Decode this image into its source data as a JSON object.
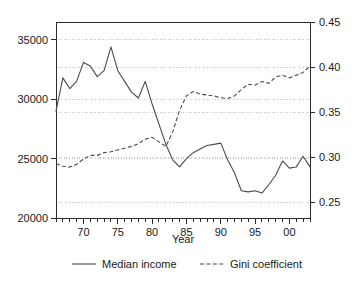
{
  "chart_data": {
    "type": "line",
    "title": "",
    "xlabel": "Year",
    "ylabel": "",
    "grid": true,
    "legend_position": "bottom",
    "x": [
      1966,
      1967,
      1968,
      1969,
      1970,
      1971,
      1972,
      1973,
      1974,
      1975,
      1976,
      1977,
      1978,
      1979,
      1980,
      1981,
      1982,
      1983,
      1984,
      1985,
      1986,
      1987,
      1988,
      1989,
      1990,
      1991,
      1992,
      1993,
      1994,
      1995,
      1996,
      1997,
      1998,
      1999,
      2000,
      2001,
      2002,
      2003
    ],
    "x_tick_labels": [
      "70",
      "75",
      "80",
      "85",
      "90",
      "95",
      "00"
    ],
    "x_tick_values": [
      1970,
      1975,
      1980,
      1985,
      1990,
      1995,
      2000
    ],
    "xlim": [
      1966,
      2003
    ],
    "left_axis": {
      "label": "Median income",
      "ylim": [
        20000,
        36500
      ],
      "ticks": [
        20000,
        25000,
        30000,
        35000
      ],
      "tick_labels": [
        "20000",
        "25000",
        "30000",
        "35000"
      ]
    },
    "right_axis": {
      "label": "Gini coefficient",
      "ylim": [
        0.2325,
        0.45
      ],
      "ticks": [
        0.25,
        0.3,
        0.35,
        0.4,
        0.45
      ],
      "tick_labels": [
        "0.25",
        "0.30",
        "0.35",
        "0.40",
        "0.45"
      ]
    },
    "series": [
      {
        "name": "Median income",
        "axis": "left",
        "style": "solid",
        "color": "#4a4a4a",
        "values": [
          29000,
          31800,
          30900,
          31500,
          33100,
          32800,
          31900,
          32400,
          34400,
          32400,
          31500,
          30600,
          30100,
          31500,
          29600,
          27900,
          26200,
          24900,
          24300,
          25000,
          25500,
          25800,
          26100,
          26200,
          26300,
          24900,
          23800,
          22300,
          22200,
          22300,
          22100,
          22800,
          23600,
          24800,
          24200,
          24300,
          25200,
          24300
        ]
      },
      {
        "name": "Gini coefficient",
        "axis": "right",
        "style": "dashed",
        "color": "#4a4a4a",
        "values": [
          0.293,
          0.29,
          0.289,
          0.292,
          0.298,
          0.302,
          0.302,
          0.305,
          0.306,
          0.308,
          0.31,
          0.312,
          0.315,
          0.32,
          0.322,
          0.317,
          0.312,
          0.328,
          0.352,
          0.368,
          0.373,
          0.37,
          0.369,
          0.368,
          0.366,
          0.365,
          0.368,
          0.375,
          0.381,
          0.38,
          0.384,
          0.382,
          0.389,
          0.391,
          0.388,
          0.391,
          0.394,
          0.401
        ]
      }
    ],
    "legend": [
      {
        "label": "Median income",
        "style": "solid"
      },
      {
        "label": "Gini coefficient",
        "style": "dashed"
      }
    ]
  }
}
